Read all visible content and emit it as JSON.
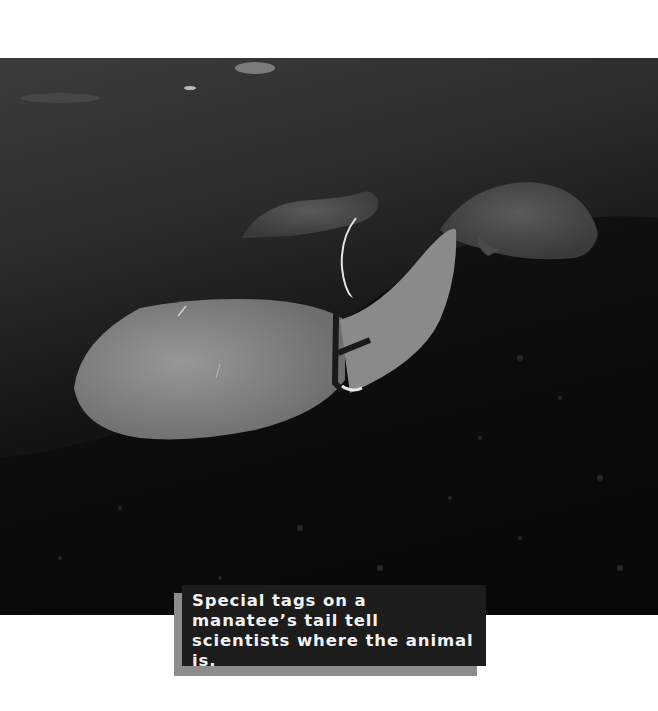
{
  "photo": {
    "subject": "Three manatees underwater; the nearest has a tracking tag strapped around its tail",
    "colors": {
      "water_top": "#3a3a3a",
      "water_mid": "#2a2a2a",
      "floor": "#050505",
      "manatee": "#8e8e8e",
      "tag": "#1a1a1a",
      "antenna": "#e8e8e8"
    }
  },
  "caption": {
    "text": "Special tags on a manatee’s tail tell scientists where the animal is.",
    "box_color": "#1c1c1c",
    "shadow_color": "#8c8c8c",
    "text_color": "#f2f2f2"
  }
}
